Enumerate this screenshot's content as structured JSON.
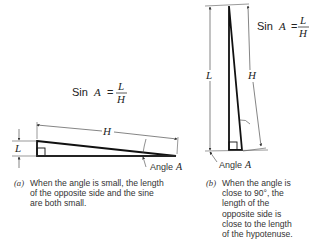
{
  "figure_a": {
    "formula": {
      "prefix": "Sin ",
      "var": "A",
      "equals": "=",
      "numerator": "L",
      "denominator": "H"
    },
    "label_opposite": "L",
    "label_hypotenuse": "H",
    "angle_label": {
      "text": "Angle ",
      "var": "A"
    },
    "caption_tag": "(a)",
    "caption_lines": [
      "When the angle is small, the length",
      "of the opposite side and the sine",
      "are both small."
    ]
  },
  "figure_b": {
    "formula": {
      "prefix": "Sin ",
      "var": "A",
      "equals": "=",
      "numerator": "L",
      "denominator": "H"
    },
    "label_opposite": "L",
    "label_hypotenuse": "H",
    "angle_label": {
      "text": "Angle ",
      "var": "A"
    },
    "caption_tag": "(b)",
    "caption_lines": [
      "When the angle is",
      "close to 90°, the",
      "length of the",
      "opposite side is",
      "close to the length",
      "of the hypotenuse."
    ]
  }
}
